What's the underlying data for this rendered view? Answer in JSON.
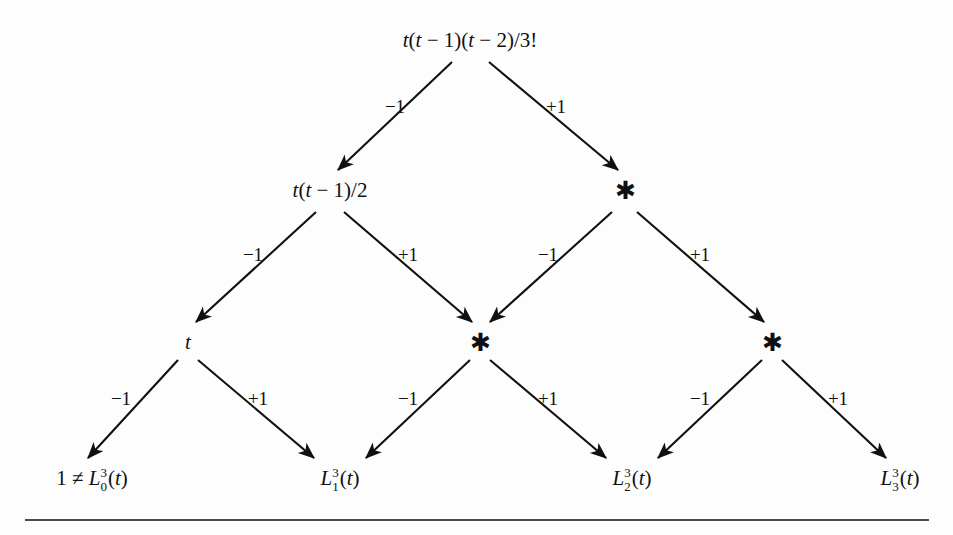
{
  "figure": {
    "type": "binary-tree-diagram",
    "background_color": "#fdfdfd",
    "ink_color": "#101010",
    "rule_color": "#4a4a4a"
  },
  "nodes": {
    "root": {
      "id": "root",
      "label": "t(t − 1)(t − 2)/3!",
      "x": 470,
      "y": 40,
      "level": 0
    },
    "level1_left": {
      "id": "level1-left",
      "label": "t(t − 1)/2",
      "x": 330,
      "y": 190,
      "level": 1
    },
    "level1_right": {
      "id": "level1-right",
      "label": "*",
      "x": 625,
      "y": 190,
      "level": 1
    },
    "level2_a": {
      "id": "level2-a",
      "label": "t",
      "x": 188,
      "y": 342,
      "level": 2
    },
    "level2_b": {
      "id": "level2-b",
      "label": "*",
      "x": 480,
      "y": 342,
      "level": 2
    },
    "level2_c": {
      "id": "level2-c",
      "label": "*",
      "x": 772,
      "y": 342,
      "level": 2
    },
    "leaf_0": {
      "id": "leaf-0",
      "prefix": "1 ≠ ",
      "base": "L",
      "superscript": "3",
      "subscript": "0",
      "argument": "(t)",
      "x": 92,
      "y": 480,
      "level": 3
    },
    "leaf_1": {
      "id": "leaf-1",
      "prefix": "",
      "base": "L",
      "superscript": "3",
      "subscript": "1",
      "argument": "(t)",
      "x": 340,
      "y": 480,
      "level": 3
    },
    "leaf_2": {
      "id": "leaf-2",
      "prefix": "",
      "base": "L",
      "superscript": "3",
      "subscript": "2",
      "argument": "(t)",
      "x": 632,
      "y": 480,
      "level": 3
    },
    "leaf_3": {
      "id": "leaf-3",
      "prefix": "",
      "base": "L",
      "superscript": "3",
      "subscript": "3",
      "argument": "(t)",
      "x": 900,
      "y": 480,
      "level": 3
    }
  },
  "edges": [
    {
      "id": "e-root-l",
      "from": "root",
      "to": "level1_left",
      "label": "−1",
      "label_x": 395,
      "label_y": 106,
      "x1": 452,
      "y1": 62,
      "x2": 338,
      "y2": 170
    },
    {
      "id": "e-root-r",
      "from": "root",
      "to": "level1_right",
      "label": "+1",
      "label_x": 556,
      "label_y": 106,
      "x1": 489,
      "y1": 62,
      "x2": 618,
      "y2": 170
    },
    {
      "id": "e-l1l-l",
      "from": "level1_left",
      "to": "level2_a",
      "label": "−1",
      "label_x": 253,
      "label_y": 254,
      "x1": 316,
      "y1": 212,
      "x2": 196,
      "y2": 322
    },
    {
      "id": "e-l1l-r",
      "from": "level1_left",
      "to": "level2_b",
      "label": "+1",
      "label_x": 408,
      "label_y": 254,
      "x1": 344,
      "y1": 212,
      "x2": 472,
      "y2": 322
    },
    {
      "id": "e-l1r-l",
      "from": "level1_right",
      "to": "level2_b",
      "label": "−1",
      "label_x": 548,
      "label_y": 254,
      "x1": 612,
      "y1": 212,
      "x2": 490,
      "y2": 322
    },
    {
      "id": "e-l1r-r",
      "from": "level1_right",
      "to": "level2_c",
      "label": "+1",
      "label_x": 700,
      "label_y": 254,
      "x1": 637,
      "y1": 212,
      "x2": 764,
      "y2": 322
    },
    {
      "id": "e-l2a-l",
      "from": "level2_a",
      "to": "leaf_0",
      "label": "−1",
      "label_x": 121,
      "label_y": 398,
      "x1": 178,
      "y1": 360,
      "x2": 88,
      "y2": 458
    },
    {
      "id": "e-l2a-r",
      "from": "level2_a",
      "to": "leaf_1",
      "label": "+1",
      "label_x": 258,
      "label_y": 398,
      "x1": 198,
      "y1": 360,
      "x2": 314,
      "y2": 458
    },
    {
      "id": "e-l2b-l",
      "from": "level2_b",
      "to": "leaf_1",
      "label": "−1",
      "label_x": 408,
      "label_y": 398,
      "x1": 470,
      "y1": 360,
      "x2": 366,
      "y2": 458
    },
    {
      "id": "e-l2b-r",
      "from": "level2_b",
      "to": "leaf_2",
      "label": "+1",
      "label_x": 548,
      "label_y": 398,
      "x1": 490,
      "y1": 360,
      "x2": 606,
      "y2": 458
    },
    {
      "id": "e-l2c-l",
      "from": "level2_c",
      "to": "leaf_2",
      "label": "−1",
      "label_x": 700,
      "label_y": 398,
      "x1": 762,
      "y1": 360,
      "x2": 658,
      "y2": 458
    },
    {
      "id": "e-l2c-r",
      "from": "level2_c",
      "to": "leaf_3",
      "label": "+1",
      "label_x": 838,
      "label_y": 398,
      "x1": 782,
      "y1": 360,
      "x2": 886,
      "y2": 458
    }
  ]
}
